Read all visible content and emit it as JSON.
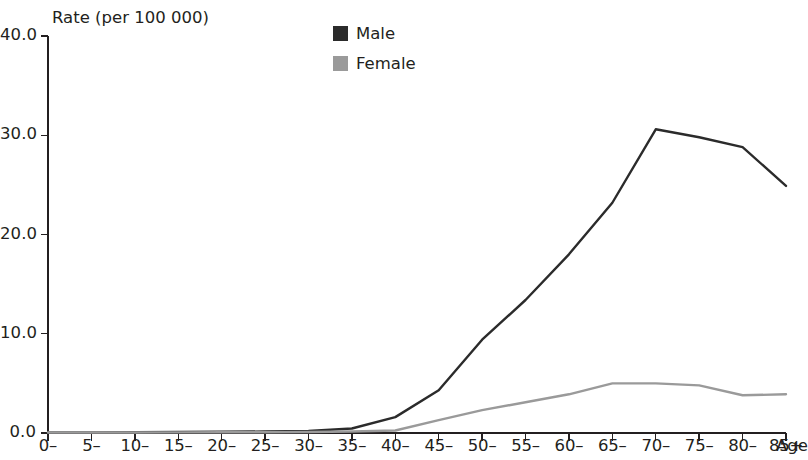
{
  "chart_data": {
    "type": "line",
    "title": "",
    "subtitle": "",
    "ylabel": "Rate (per 100 000)",
    "xlabel": "Age",
    "categories": [
      "0–",
      "5–",
      "10–",
      "15–",
      "20–",
      "25–",
      "30–",
      "35–",
      "40–",
      "45–",
      "50–",
      "55–",
      "60–",
      "65–",
      "70–",
      "75–",
      "80–",
      "85+"
    ],
    "ylim": [
      0,
      40
    ],
    "yticks": [
      0,
      10,
      20,
      30,
      40
    ],
    "ytick_labels": [
      "0.0",
      "10.0",
      "20.0",
      "30.0",
      "40.0"
    ],
    "grid": false,
    "legend_position": "top-center",
    "series": [
      {
        "name": "Male",
        "color": "#2b2b2b",
        "values": [
          0.05,
          0.05,
          0.08,
          0.1,
          0.12,
          0.15,
          0.2,
          0.45,
          1.6,
          4.3,
          9.4,
          13.4,
          18.0,
          23.2,
          30.6,
          29.8,
          28.8,
          24.9
        ]
      },
      {
        "name": "Female",
        "color": "#9a9a9a",
        "values": [
          0.05,
          0.05,
          0.05,
          0.06,
          0.07,
          0.08,
          0.1,
          0.15,
          0.25,
          1.3,
          2.3,
          3.1,
          3.9,
          5.0,
          5.0,
          4.8,
          3.8,
          3.9
        ]
      }
    ]
  },
  "legend": {
    "items": [
      {
        "label": "Male",
        "color": "#2b2b2b"
      },
      {
        "label": "Female",
        "color": "#9a9a9a"
      }
    ]
  },
  "axes": {
    "y_axis_title": "Rate (per 100 000)",
    "x_axis_title": "Age"
  }
}
